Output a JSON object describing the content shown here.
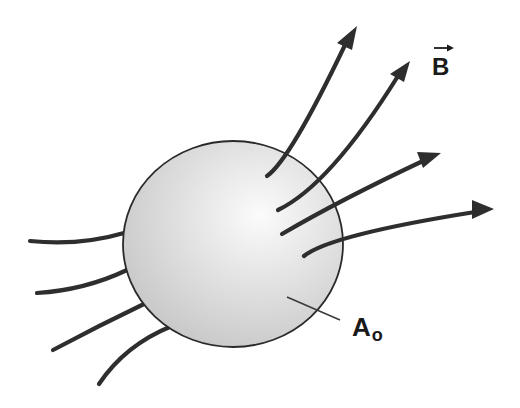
{
  "figure": {
    "type": "physics-diagram",
    "colors": {
      "background": "#ffffff",
      "line": "#2e2e2e",
      "sphere_highlight": "#fbfbfb",
      "sphere_shade": "#c9c9c9",
      "sphere_outline": "#2a2a2a",
      "label": "#1a1a1a"
    }
  },
  "labels": {
    "field": {
      "symbol": "B",
      "vector_arrow": "→",
      "meaning": "magnetic field vector"
    },
    "surface": {
      "symbol": "A",
      "subscript": "o",
      "meaning": "closed surface area"
    }
  },
  "sphere": {
    "cx": 233,
    "cy": 244,
    "rx": 110,
    "ry": 103
  },
  "field_lines": {
    "incoming": [
      {
        "id": "in-1",
        "path": "M30,241 Q80,246 124,233"
      },
      {
        "id": "in-2",
        "path": "M37,293 Q85,290 127,270"
      },
      {
        "id": "in-3",
        "path": "M53,350 Q100,325 146,303"
      },
      {
        "id": "in-4",
        "path": "M99,384 Q125,345 172,326"
      }
    ],
    "outgoing": [
      {
        "id": "out-1",
        "path": "M267,176 Q290,160 345,45",
        "tip": [
          357,
          27
        ]
      },
      {
        "id": "out-2",
        "path": "M278,210 Q330,185 398,76",
        "tip": [
          410,
          62
        ]
      },
      {
        "id": "out-3",
        "path": "M282,234 Q340,200 425,160",
        "tip": [
          441,
          153
        ]
      },
      {
        "id": "out-4",
        "path": "M304,256 Q330,235 475,212",
        "tip": [
          493,
          209
        ]
      }
    ],
    "arrowheads": [
      {
        "id": "head-1",
        "points": "357,26 337,43 352,50"
      },
      {
        "id": "head-2",
        "points": "410,61 390,74 404,82"
      },
      {
        "id": "head-3",
        "points": "441,153 417,152 423,168"
      },
      {
        "id": "head-4",
        "points": "494,209 472,200 472,219"
      }
    ]
  },
  "pointer": {
    "from": [
      287,
      297
    ],
    "to": [
      340,
      320
    ]
  }
}
